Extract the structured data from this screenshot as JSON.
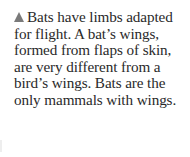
{
  "caption": {
    "marker_icon": "triangle-up-icon",
    "marker_color": "#7a7a7a",
    "text": "Bats have limbs adapted for flight. A bat’s wings, formed from flaps of skin, are very different from a bird’s wings. Bats are the only mammals with wings."
  }
}
